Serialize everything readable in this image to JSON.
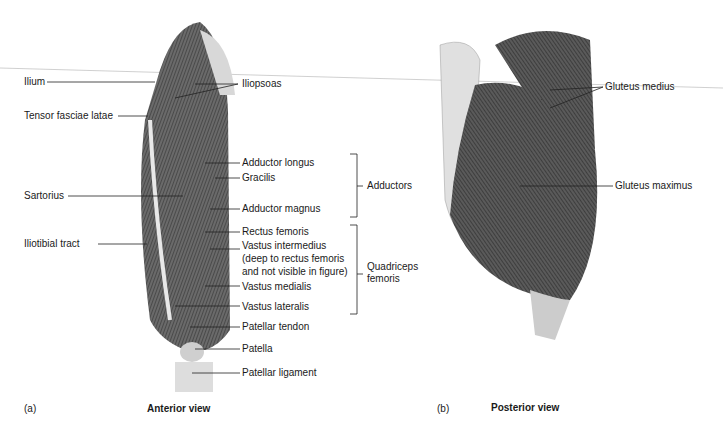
{
  "panel_a": {
    "letter": "(a)",
    "title": "Anterior view",
    "left_labels": [
      "Ilium",
      "Tensor fasciae latae",
      "Sartorius",
      "Iliotibial tract"
    ],
    "right_labels": [
      "Iliopsoas",
      "Adductor longus",
      "Gracilis",
      "Adductor magnus",
      "Rectus femoris",
      "Vastus intermedius",
      "(deep to rectus femoris",
      "and not visible in figure)",
      "Vastus medialis",
      "Vastus lateralis",
      "Patellar tendon",
      "Patella",
      "Patellar ligament"
    ],
    "groups": [
      "Adductors",
      "Quadriceps",
      "femoris"
    ]
  },
  "panel_b": {
    "letter": "(b)",
    "title": "Posterior view",
    "labels": [
      "Gluteus medius",
      "Gluteus maximus"
    ]
  }
}
